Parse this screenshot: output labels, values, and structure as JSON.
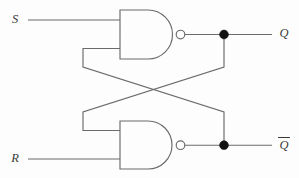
{
  "diagram": {
    "type": "logic-circuit",
    "background_color": "#fdfdfd",
    "wire_color": "#6b6b6b",
    "junction_color": "#111111",
    "label_color": "#3a3a3a",
    "labels": {
      "set_input": "S",
      "reset_input": "R",
      "q_output": "Q",
      "qbar_output": "Q",
      "qbar_has_overbar": true
    },
    "gates": [
      {
        "id": "top-nand",
        "type": "NAND",
        "inputs": [
          "S",
          "Q-bar feedback"
        ],
        "output": "Q"
      },
      {
        "id": "bottom-nand",
        "type": "NAND",
        "inputs": [
          "Q feedback",
          "R"
        ],
        "output": "Q-bar"
      }
    ],
    "nodes": [
      {
        "id": "q-junction",
        "label": "Q",
        "x": 224,
        "y": 34
      },
      {
        "id": "qbar-junction",
        "label": "Q-bar",
        "x": 224,
        "y": 137
      }
    ],
    "cross_coupling": [
      {
        "from": "q-junction",
        "to": "bottom-nand input 1"
      },
      {
        "from": "qbar-junction",
        "to": "top-nand input 2"
      }
    ]
  }
}
